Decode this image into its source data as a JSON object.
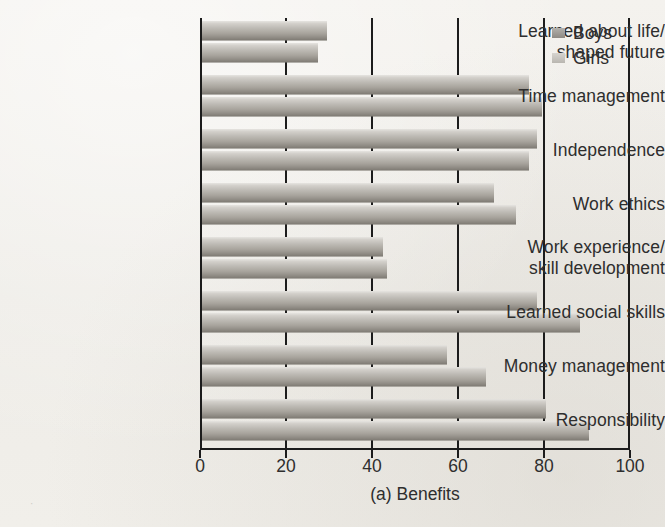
{
  "figure": {
    "caption": "(a) Benefits",
    "background_color": "#f2f0ec",
    "axis_color": "#1c1c1c"
  },
  "legend": {
    "position": "top-right",
    "entries": [
      {
        "label": "Boys",
        "swatch": "boys-swatch",
        "color": "#8e8a84"
      },
      {
        "label": "Girls",
        "swatch": "girls-swatch",
        "color": "#b9b6b0"
      }
    ]
  },
  "axis": {
    "x_ticks": [
      "0",
      "20",
      "40",
      "60",
      "80",
      "100"
    ],
    "x_label": "(a) Benefits"
  },
  "categories": [
    {
      "line1": "Learned about life/",
      "line2": "shaped future"
    },
    {
      "line1": "Time management",
      "line2": ""
    },
    {
      "line1": "Independence",
      "line2": ""
    },
    {
      "line1": "Work ethics",
      "line2": ""
    },
    {
      "line1": "Work experience/",
      "line2": "skill development"
    },
    {
      "line1": "Learned social skills",
      "line2": ""
    },
    {
      "line1": "Money management",
      "line2": ""
    },
    {
      "line1": "Responsibility",
      "line2": ""
    }
  ],
  "chart_data": {
    "type": "bar",
    "orientation": "horizontal",
    "title": "",
    "subtitle": "",
    "xlabel": "(a) Benefits",
    "ylabel": "",
    "xlim": [
      0,
      100
    ],
    "xticks": [
      0,
      20,
      40,
      60,
      80,
      100
    ],
    "grid": true,
    "grid_axis": "x",
    "legend_position": "top-right",
    "categories": [
      "Learned about life/ shaped future",
      "Time management",
      "Independence",
      "Work ethics",
      "Work experience/ skill development",
      "Learned social skills",
      "Money management",
      "Responsibility"
    ],
    "series": [
      {
        "name": "Boys",
        "color": "#8e8a84",
        "values": [
          29,
          76,
          78,
          68,
          42,
          78,
          57,
          80
        ]
      },
      {
        "name": "Girls",
        "color": "#b9b6b0",
        "values": [
          27,
          79,
          76,
          73,
          43,
          88,
          66,
          90
        ]
      }
    ]
  }
}
